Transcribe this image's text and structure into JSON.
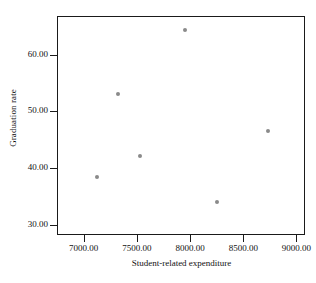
{
  "chart_data": {
    "type": "scatter",
    "title": "",
    "xlabel": "Student-related expenditure",
    "ylabel": "Graduation rate",
    "xlim": [
      6750,
      9080
    ],
    "ylim": [
      28.2,
      66.8
    ],
    "grid": false,
    "legend": null,
    "xticks": [
      7000,
      7500,
      8000,
      8500,
      9000
    ],
    "xticklabels": [
      "7000.00",
      "7500.00",
      "8000.00",
      "8500.00",
      "9000.00"
    ],
    "yticks": [
      30,
      40,
      50,
      60
    ],
    "yticklabels": [
      "30.00",
      "40.00",
      "50.00",
      "60.00"
    ],
    "marker_color": "#8a8a8a",
    "frame_color": "#1a1a1a",
    "points": [
      {
        "x": 7130,
        "y": 38.4
      },
      {
        "x": 7320,
        "y": 53.0
      },
      {
        "x": 7530,
        "y": 42.2
      },
      {
        "x": 7950,
        "y": 64.4
      },
      {
        "x": 8250,
        "y": 34.0
      },
      {
        "x": 8730,
        "y": 46.5
      }
    ]
  }
}
